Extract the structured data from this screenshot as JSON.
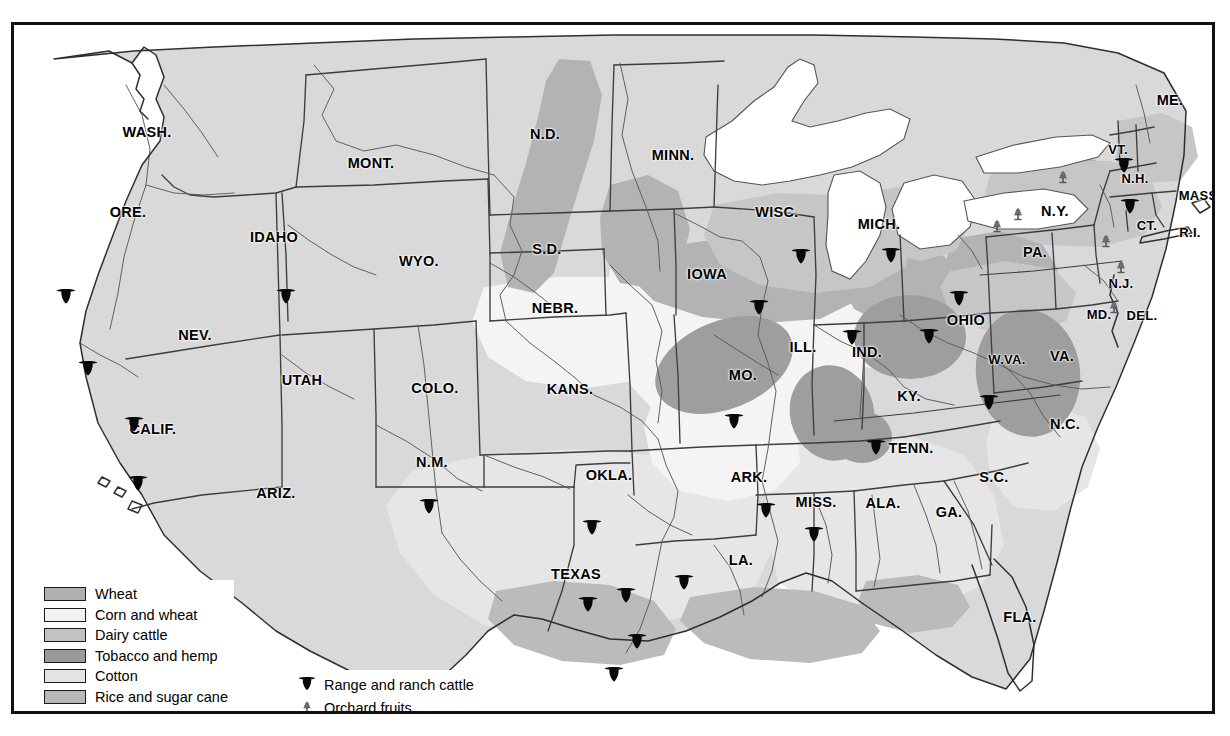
{
  "map": {
    "title": "United States agricultural regions map",
    "background_color": "#ffffff",
    "frame_color": "#111111",
    "base_land_color": "#d9d9d9",
    "water_color": "#ffffff",
    "border_line_color": "#3a3a3a",
    "river_line_color": "#555555"
  },
  "legend": {
    "items": [
      {
        "label": "Wheat",
        "color": "#b0b0b0",
        "key": "wheat"
      },
      {
        "label": "Corn and wheat",
        "color": "#f2f2f2",
        "key": "corn-and-wheat"
      },
      {
        "label": "Dairy cattle",
        "color": "#c2c2c2",
        "key": "dairy-cattle"
      },
      {
        "label": "Tobacco and hemp",
        "color": "#9a9a9a",
        "key": "tobacco-and-hemp"
      },
      {
        "label": "Cotton",
        "color": "#e4e4e4",
        "key": "cotton"
      },
      {
        "label": "Rice and sugar cane",
        "color": "#b8b8b8",
        "key": "rice-and-sugar-cane"
      }
    ]
  },
  "legend_symbols": {
    "items": [
      {
        "label": "Range and ranch cattle",
        "symbol": "cattle-head-icon"
      },
      {
        "label": "Orchard fruits",
        "symbol": "orchard-tree-icon"
      }
    ]
  },
  "state_labels": [
    {
      "name": "WASH.",
      "x": 133,
      "y": 107,
      "size": "s14"
    },
    {
      "name": "ORE.",
      "x": 114,
      "y": 187,
      "size": "s14"
    },
    {
      "name": "IDAHO",
      "x": 260,
      "y": 212,
      "size": "s14"
    },
    {
      "name": "MONT.",
      "x": 357,
      "y": 138,
      "size": "s14"
    },
    {
      "name": "WYO.",
      "x": 405,
      "y": 236,
      "size": "s14"
    },
    {
      "name": "NEV.",
      "x": 181,
      "y": 310,
      "size": "s14"
    },
    {
      "name": "UTAH",
      "x": 288,
      "y": 355,
      "size": "s14"
    },
    {
      "name": "CALIF.",
      "x": 139,
      "y": 404,
      "size": "s14"
    },
    {
      "name": "ARIZ.",
      "x": 262,
      "y": 468,
      "size": "s14"
    },
    {
      "name": "COLO.",
      "x": 421,
      "y": 363,
      "size": "s14"
    },
    {
      "name": "N.M.",
      "x": 418,
      "y": 437,
      "size": "s14"
    },
    {
      "name": "N.D.",
      "x": 531,
      "y": 109,
      "size": "s14"
    },
    {
      "name": "S.D.",
      "x": 533,
      "y": 224,
      "size": "s14"
    },
    {
      "name": "NEBR.",
      "x": 541,
      "y": 283,
      "size": "s14"
    },
    {
      "name": "KANS.",
      "x": 556,
      "y": 364,
      "size": "s14"
    },
    {
      "name": "OKLA.",
      "x": 595,
      "y": 450,
      "size": "s14"
    },
    {
      "name": "TEXAS",
      "x": 562,
      "y": 549,
      "size": "s14"
    },
    {
      "name": "MINN.",
      "x": 659,
      "y": 130,
      "size": "s14"
    },
    {
      "name": "IOWA",
      "x": 693,
      "y": 249,
      "size": "s14"
    },
    {
      "name": "MO.",
      "x": 729,
      "y": 350,
      "size": "s14"
    },
    {
      "name": "ARK.",
      "x": 735,
      "y": 452,
      "size": "s14"
    },
    {
      "name": "LA.",
      "x": 727,
      "y": 535,
      "size": "s14"
    },
    {
      "name": "WISC.",
      "x": 763,
      "y": 187,
      "size": "s14"
    },
    {
      "name": "ILL.",
      "x": 789,
      "y": 322,
      "size": "s14"
    },
    {
      "name": "MISS.",
      "x": 802,
      "y": 477,
      "size": "s14"
    },
    {
      "name": "MICH.",
      "x": 865,
      "y": 199,
      "size": "s14"
    },
    {
      "name": "IND.",
      "x": 853,
      "y": 327,
      "size": "s14"
    },
    {
      "name": "TENN.",
      "x": 897,
      "y": 423,
      "size": "s14"
    },
    {
      "name": "ALA.",
      "x": 869,
      "y": 478,
      "size": "s14"
    },
    {
      "name": "KY.",
      "x": 895,
      "y": 371,
      "size": "s14"
    },
    {
      "name": "OHIO",
      "x": 952,
      "y": 295,
      "size": "s14"
    },
    {
      "name": "GA.",
      "x": 935,
      "y": 487,
      "size": "s14"
    },
    {
      "name": "S.C.",
      "x": 980,
      "y": 452,
      "size": "s14"
    },
    {
      "name": "FLA.",
      "x": 1006,
      "y": 592,
      "size": "s14"
    },
    {
      "name": "W.VA.",
      "x": 993,
      "y": 334,
      "size": "s13"
    },
    {
      "name": "VA.",
      "x": 1048,
      "y": 331,
      "size": "s14"
    },
    {
      "name": "N.C.",
      "x": 1051,
      "y": 399,
      "size": "s14"
    },
    {
      "name": "PA.",
      "x": 1021,
      "y": 227,
      "size": "s14"
    },
    {
      "name": "N.Y.",
      "x": 1041,
      "y": 186,
      "size": "s14"
    },
    {
      "name": "MD.",
      "x": 1085,
      "y": 289,
      "size": "s13"
    },
    {
      "name": "DEL.",
      "x": 1128,
      "y": 290,
      "size": "s13"
    },
    {
      "name": "N.J.",
      "x": 1107,
      "y": 258,
      "size": "s13"
    },
    {
      "name": "VT.",
      "x": 1104,
      "y": 124,
      "size": "s13"
    },
    {
      "name": "N.H.",
      "x": 1121,
      "y": 153,
      "size": "s13"
    },
    {
      "name": "ME.",
      "x": 1156,
      "y": 75,
      "size": "s14"
    },
    {
      "name": "MASS.",
      "x": 1186,
      "y": 170,
      "size": "s13"
    },
    {
      "name": "CT.",
      "x": 1133,
      "y": 200,
      "size": "s13"
    },
    {
      "name": "R.I.",
      "x": 1176,
      "y": 207,
      "size": "s13"
    }
  ],
  "cattle_markers": [
    {
      "x": 52,
      "y": 272
    },
    {
      "x": 74,
      "y": 344
    },
    {
      "x": 120,
      "y": 400
    },
    {
      "x": 124,
      "y": 459
    },
    {
      "x": 272,
      "y": 272
    },
    {
      "x": 415,
      "y": 482
    },
    {
      "x": 578,
      "y": 503
    },
    {
      "x": 574,
      "y": 580
    },
    {
      "x": 612,
      "y": 571
    },
    {
      "x": 623,
      "y": 617
    },
    {
      "x": 600,
      "y": 650
    },
    {
      "x": 670,
      "y": 558
    },
    {
      "x": 720,
      "y": 397
    },
    {
      "x": 745,
      "y": 283
    },
    {
      "x": 752,
      "y": 486
    },
    {
      "x": 787,
      "y": 232
    },
    {
      "x": 800,
      "y": 510
    },
    {
      "x": 838,
      "y": 313
    },
    {
      "x": 862,
      "y": 423
    },
    {
      "x": 877,
      "y": 231
    },
    {
      "x": 915,
      "y": 312
    },
    {
      "x": 945,
      "y": 274
    },
    {
      "x": 975,
      "y": 378
    },
    {
      "x": 1110,
      "y": 141
    },
    {
      "x": 1116,
      "y": 182
    }
  ],
  "orchard_markers": [
    {
      "x": 1049,
      "y": 153
    },
    {
      "x": 1004,
      "y": 190
    },
    {
      "x": 1092,
      "y": 217
    },
    {
      "x": 983,
      "y": 202
    },
    {
      "x": 1107,
      "y": 243
    },
    {
      "x": 1100,
      "y": 283
    }
  ]
}
